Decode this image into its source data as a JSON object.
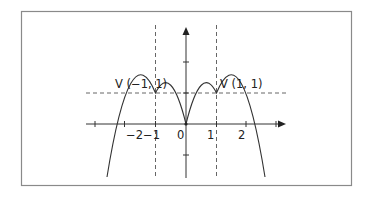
{
  "diagram": {
    "type": "function-graph",
    "equation": "y = -x^2 + 2|x|",
    "colors": {
      "frame": "#8a8a8a",
      "axis": "#333333",
      "curve": "#333333",
      "dashed": "#555555",
      "text": "#222222"
    },
    "axes": {
      "x_tick_labels": [
        "−2",
        "−1",
        "0",
        "1",
        "2"
      ],
      "x_ticks": [
        -3,
        -2,
        -1,
        1,
        2,
        3
      ],
      "y_ticks": [
        -1,
        1,
        2
      ]
    },
    "vertices": [
      {
        "label": "V (−1, 1)",
        "x": -1,
        "y": 1
      },
      {
        "label": "V (1, 1)",
        "x": 1,
        "y": 1
      }
    ],
    "guides": {
      "vertical_dashed": [
        -1,
        1
      ],
      "horizontal_dashed": [
        1
      ]
    },
    "x_intercepts": [
      -2,
      0,
      2
    ]
  }
}
